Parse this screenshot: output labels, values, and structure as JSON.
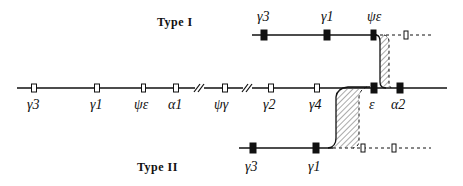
{
  "title_type1": "Type I",
  "title_type2": "Type II",
  "normal_chromosome": {
    "genes": [
      {
        "label": "γ3",
        "x": 34,
        "filled": false
      },
      {
        "label": "γ1",
        "x": 97,
        "filled": false
      },
      {
        "label": "ψε",
        "x": 144,
        "filled": false
      },
      {
        "label": "α1",
        "x": 176,
        "filled": false
      },
      {
        "label": "ψγ",
        "x": 225,
        "filled": false
      },
      {
        "label": "γ2",
        "x": 271,
        "filled": false
      },
      {
        "label": "γ4",
        "x": 317,
        "filled": false
      },
      {
        "label": "ε",
        "x": 374,
        "filled": true
      },
      {
        "label": "α2",
        "x": 400,
        "filled": true
      }
    ],
    "breaks": [
      199,
      247
    ]
  },
  "type1_chromosome": {
    "genes": [
      {
        "label": "γ3",
        "x": 264,
        "filled": true
      },
      {
        "label": "γ1",
        "x": 327,
        "filled": true
      },
      {
        "label": "ψε",
        "x": 374,
        "filled": true
      },
      {
        "label": "",
        "x": 406,
        "filled": false
      }
    ]
  },
  "type2_chromosome": {
    "genes": [
      {
        "label": "γ3",
        "x": 253,
        "filled": true
      },
      {
        "label": "γ1",
        "x": 316,
        "filled": true
      },
      {
        "label": "",
        "x": 363,
        "filled": false
      },
      {
        "label": "",
        "x": 394,
        "filled": false
      }
    ]
  },
  "colors": {
    "ink": "#111111",
    "background": "#ffffff",
    "hatch": "#555555"
  }
}
